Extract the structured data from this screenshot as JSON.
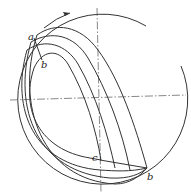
{
  "diagram": {
    "labels": {
      "a_top": "a",
      "b_top": "b",
      "c_bottom": "c",
      "b_bottom": "b"
    },
    "colors": {
      "line": "#333333",
      "background": "#ffffff"
    }
  }
}
